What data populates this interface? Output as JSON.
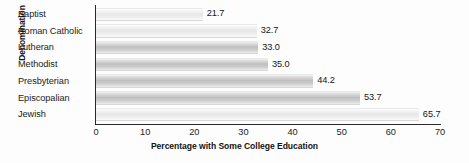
{
  "chart_data": {
    "type": "bar",
    "orientation": "horizontal",
    "title": "",
    "xlabel": "Percentage with Some College Education",
    "ylabel": "Denomination",
    "categories": [
      "Baptist",
      "Roman Catholic",
      "Lutheran",
      "Methodist",
      "Presbyterian",
      "Episcopalian",
      "Jewish"
    ],
    "values": [
      21.7,
      32.7,
      33.0,
      35.0,
      44.2,
      53.7,
      65.7
    ],
    "value_labels": [
      "21.7",
      "32.7",
      "33.0",
      "35.0",
      "44.2",
      "53.7",
      "65.7"
    ],
    "xticks": [
      0,
      10,
      20,
      30,
      40,
      50,
      60,
      70
    ],
    "xtick_labels": [
      "0",
      "10",
      "20",
      "30",
      "40",
      "50",
      "60",
      "70"
    ],
    "xlim": [
      0,
      70
    ],
    "grid": false,
    "legend": false,
    "bar_shading": [
      "light",
      "light",
      "dark",
      "dark",
      "dark",
      "dark",
      "light"
    ],
    "colors": {
      "axis": "#2a2a2a",
      "bar_light": "#eeeeee",
      "bar_dark": "#c6c6c6",
      "text": "#1b1b1b",
      "background": "#fdfdfd"
    }
  }
}
